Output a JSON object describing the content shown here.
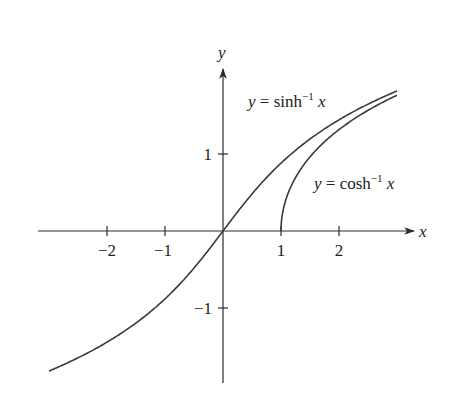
{
  "chart_data": {
    "type": "line",
    "title": "",
    "xlabel": "x",
    "ylabel": "y",
    "xlim": [
      -3.0,
      3.3
    ],
    "ylim": [
      -2.0,
      2.1
    ],
    "x_ticks": [
      -2,
      -1,
      1,
      2
    ],
    "x_tick_labels": [
      "−2",
      "−1",
      "1",
      "2"
    ],
    "y_ticks": [
      1,
      -1
    ],
    "y_tick_labels": [
      "1",
      "−1"
    ],
    "grid": false,
    "legend": "none (curves labeled inline)",
    "series": [
      {
        "name": "y = sinh⁻¹ x",
        "function": "asinh",
        "domain": [
          -3.0,
          3.0
        ],
        "x": [
          -3,
          -2,
          -1,
          0,
          1,
          2,
          3
        ],
        "values": [
          -1.818,
          -1.444,
          -0.881,
          0,
          0.881,
          1.444,
          1.818
        ]
      },
      {
        "name": "y = cosh⁻¹ x",
        "function": "acosh",
        "domain": [
          1.0,
          3.0
        ],
        "x": [
          1,
          1.5,
          2,
          2.5,
          3
        ],
        "values": [
          0,
          0.962,
          1.317,
          1.567,
          1.763
        ]
      }
    ],
    "annotations": [
      {
        "text": "y = sinh⁻¹ x",
        "near": "upper curve"
      },
      {
        "text": "y = cosh⁻¹ x",
        "near": "lower-right curve"
      }
    ]
  },
  "labels": {
    "x_axis": "x",
    "y_axis": "y",
    "sinh_label": {
      "pre": "y = sinh",
      "sup": "−1",
      "post": "x"
    },
    "cosh_label": {
      "pre": "y = cosh",
      "sup": "−1",
      "post": "x"
    },
    "ticks": {
      "xm2": "−2",
      "xm1": "−1",
      "x1": "1",
      "x2": "2",
      "y1": "1",
      "ym1": "−1"
    }
  }
}
